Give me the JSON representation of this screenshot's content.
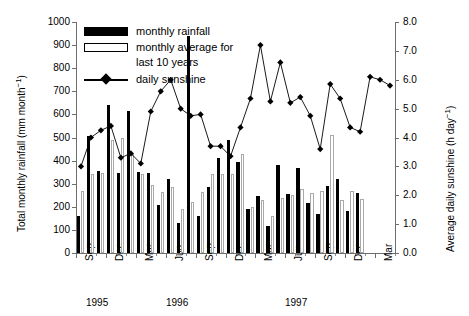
{
  "chart_data": {
    "type": "bar",
    "title": "",
    "subtitle": "",
    "xlabel": "",
    "ylabel": "Total monthly rainfall (mm month⁻¹)",
    "y2label": "Average daily sunshine (h day⁻¹)",
    "ylim": [
      0,
      1000
    ],
    "y2lim": [
      0,
      8
    ],
    "yticks": [
      0,
      100,
      200,
      300,
      400,
      500,
      600,
      700,
      800,
      900,
      1000
    ],
    "ytick_labels": [
      "0",
      "100",
      "200",
      "300",
      "400",
      "500",
      "600",
      "700",
      "800",
      "900",
      "1000"
    ],
    "y2ticks": [
      0,
      1,
      2,
      3,
      4,
      5,
      6,
      7,
      8
    ],
    "y2tick_labels": [
      "0.0",
      "1.0",
      "2.0",
      "3.0",
      "4.0",
      "5.0",
      "6.0",
      "7.0",
      "8.0"
    ],
    "grid": false,
    "legend_position": "top-left",
    "legend": [
      {
        "key": "monthly-rainfall",
        "label": "monthly rainfall",
        "style": "filled-black-bar"
      },
      {
        "key": "monthly-average",
        "label": "monthly average for",
        "label2": "last 10 years",
        "style": "open-white-bar"
      },
      {
        "key": "daily-sunshine",
        "label": "daily sunshine",
        "style": "line-diamond-marker"
      }
    ],
    "categories": [
      "Sep 1995",
      "Oct 1995",
      "Nov 1995",
      "Dec 1995",
      "Jan 1996",
      "Feb 1996",
      "Mar 1996",
      "Apr 1996",
      "May 1996",
      "Jun 1996",
      "Jul 1996",
      "Aug 1996",
      "Sep 1996",
      "Oct 1996",
      "Nov 1996",
      "Dec 1996",
      "Jan 1997",
      "Feb 1997",
      "Mar 1997",
      "Apr 1997",
      "May 1997",
      "Jun 1997",
      "Jul 1997",
      "Aug 1997",
      "Sep 1997",
      "Oct 1997",
      "Nov 1997",
      "Dec 1997",
      "Jan 1998",
      "Feb 1998",
      "Mar 1998",
      "Apr 1998"
    ],
    "xtick_labels": [
      "Sep",
      "Dec",
      "Mar",
      "Jun",
      "Sep",
      "Dec",
      "Mar",
      "Jun",
      "Sep",
      "Dec",
      "Mar"
    ],
    "xtick_category_index": [
      0,
      3,
      6,
      9,
      12,
      15,
      18,
      21,
      24,
      27,
      30
    ],
    "year_labels": [
      {
        "text": "1995",
        "category_index": 1
      },
      {
        "text": "1996",
        "category_index": 9
      },
      {
        "text": "1997",
        "category_index": 21
      }
    ],
    "series": [
      {
        "name": "monthly rainfall",
        "units": "mm month⁻¹",
        "axis": "left",
        "color": "#000000",
        "values": [
          160,
          505,
          355,
          640,
          345,
          615,
          350,
          345,
          210,
          320,
          130,
          940,
          160,
          285,
          410,
          490,
          395,
          190,
          245,
          115,
          380,
          255,
          370,
          215,
          170,
          290,
          320,
          180,
          260,
          0,
          0,
          0
        ]
      },
      {
        "name": "monthly average for last 10 years",
        "units": "mm month⁻¹",
        "axis": "left",
        "color": "#ffffff",
        "edge_color": "#a9a9a9",
        "values": [
          270,
          340,
          345,
          490,
          500,
          430,
          340,
          295,
          265,
          285,
          190,
          220,
          265,
          340,
          340,
          340,
          430,
          200,
          230,
          160,
          240,
          250,
          275,
          260,
          270,
          510,
          230,
          270,
          235,
          0,
          0,
          0
        ]
      },
      {
        "name": "daily sunshine",
        "units": "h day⁻¹",
        "axis": "right",
        "color": "#000000",
        "marker": "diamond",
        "values": [
          3.0,
          4.0,
          4.25,
          4.4,
          3.3,
          3.45,
          3.1,
          4.9,
          5.6,
          6.0,
          5.0,
          4.75,
          4.8,
          3.7,
          3.7,
          3.35,
          4.35,
          5.35,
          7.2,
          5.25,
          6.6,
          5.2,
          5.4,
          4.75,
          3.6,
          5.85,
          5.35,
          4.35,
          4.2,
          6.1,
          6.0,
          5.8
        ]
      }
    ]
  }
}
